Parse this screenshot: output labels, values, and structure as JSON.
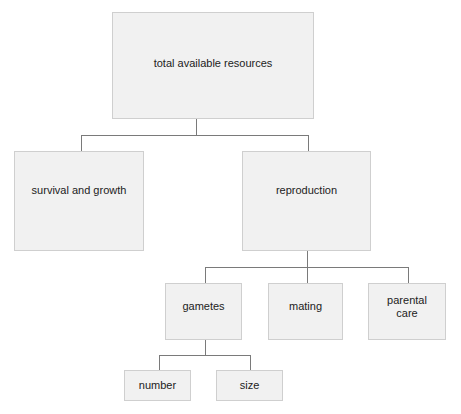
{
  "diagram": {
    "type": "hierarchy-tree",
    "colors": {
      "box_fill": "#f1f1f1",
      "box_border": "#cfcfcf",
      "connector": "#7a7a7a",
      "text": "#222222"
    },
    "nodes": {
      "total": {
        "label": "total available resources"
      },
      "survival": {
        "label": "survival and growth",
        "parent": "total"
      },
      "reproduction": {
        "label": "reproduction",
        "parent": "total"
      },
      "gametes": {
        "label": "gametes",
        "parent": "reproduction"
      },
      "mating": {
        "label": "mating",
        "parent": "reproduction"
      },
      "parental_care": {
        "label": "parental\ncare",
        "parent": "reproduction"
      },
      "number": {
        "label": "number",
        "parent": "gametes"
      },
      "size": {
        "label": "size",
        "parent": "gametes"
      }
    }
  }
}
